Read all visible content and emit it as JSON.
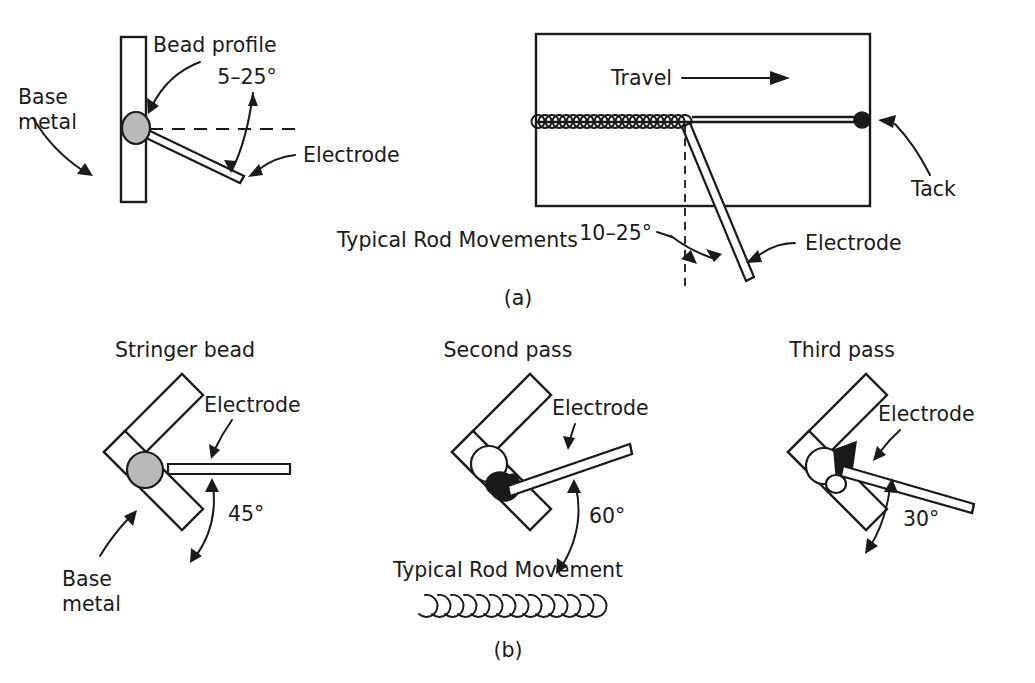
{
  "figure": {
    "panels": [
      {
        "id": "a",
        "caption": "(a)",
        "subtitle": "Typical Rod Movements",
        "views": [
          {
            "id": "vertical-fillet",
            "labels": {
              "base_metal": "Base metal",
              "bead_profile": "Bead profile",
              "electrode": "Electrode",
              "angle": "5–25°"
            }
          },
          {
            "id": "flat-plate-tack",
            "labels": {
              "travel": "Travel",
              "tack": "Tack",
              "electrode": "Electrode",
              "angle": "10–25°"
            }
          }
        ]
      },
      {
        "id": "b",
        "caption": "(b)",
        "subtitle": "Typical Rod Movement",
        "views": [
          {
            "id": "stringer-bead",
            "labels": {
              "title": "Stringer bead",
              "electrode": "Electrode",
              "angle": "45°",
              "base_metal": "Base metal"
            }
          },
          {
            "id": "second-pass",
            "labels": {
              "title": "Second pass",
              "electrode": "Electrode",
              "angle": "60°"
            }
          },
          {
            "id": "third-pass",
            "labels": {
              "title": "Third pass",
              "electrode": "Electrode",
              "angle": "30°"
            }
          }
        ]
      }
    ],
    "colors": {
      "ink": "#1a1a1a",
      "paper": "#ffffff",
      "bead_fill": "#b9b9b9",
      "bead_black": "#1a1a1a"
    }
  },
  "text": {
    "base_metal_1": "Base",
    "base_metal_2": "metal",
    "bead_profile": "Bead profile",
    "angle_5_25": "5–25°",
    "electrode_tl": "Electrode",
    "travel": "Travel",
    "tack": "Tack",
    "angle_10_25": "10–25°",
    "electrode_tr": "Electrode",
    "typical_rod_movements": "Typical Rod Movements",
    "caption_a": "(a)",
    "stringer_bead": "Stringer bead",
    "electrode_bl": "Electrode",
    "angle_45": "45°",
    "base_metal_bl_1": "Base",
    "base_metal_bl_2": "metal",
    "second_pass": "Second pass",
    "electrode_bm": "Electrode",
    "angle_60": "60°",
    "typical_rod_movement": "Typical Rod Movement",
    "caption_b": "(b)",
    "third_pass": "Third pass",
    "electrode_br": "Electrode",
    "angle_30": "30°"
  }
}
